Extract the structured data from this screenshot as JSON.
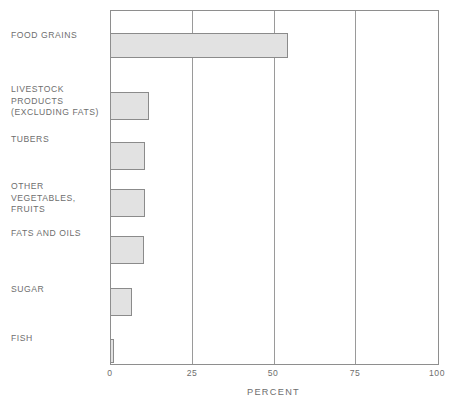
{
  "chart_data": {
    "type": "bar",
    "orientation": "horizontal",
    "title": "",
    "subtitle": "",
    "xlabel": "PERCENT",
    "ylabel": "",
    "xlim": [
      0,
      100
    ],
    "xticks": [
      "0",
      "25",
      "50",
      "75",
      "100"
    ],
    "xtick_values": [
      0,
      25,
      50,
      75,
      100
    ],
    "grid": true,
    "grid_axis": "x",
    "legend": false,
    "legend_position": "none",
    "categories": [
      "FOOD GRAINS",
      "LIVESTOCK\nPRODUCTS\n(EXCLUDING FATS)",
      "TUBERS",
      "OTHER\nVEGETABLES,\nFRUITS",
      "FATS AND OILS",
      "SUGAR",
      "FISH"
    ],
    "values": [
      54,
      11.5,
      10.5,
      10.5,
      10,
      6.5,
      1
    ],
    "bar_fill_color": "#e2e2e2",
    "bar_border_color": "#8b8b8b",
    "axis_color": "#8e8e8e",
    "text_color": "#6e6e6e"
  },
  "layout": {
    "bar_rows": [
      {
        "top": 22,
        "height": 25,
        "label_top": 30
      },
      {
        "top": 81,
        "height": 28,
        "label_top": 84
      },
      {
        "top": 131,
        "height": 28,
        "label_top": 134
      },
      {
        "top": 178,
        "height": 28,
        "label_top": 181
      },
      {
        "top": 225,
        "height": 28,
        "label_top": 228
      },
      {
        "top": 277,
        "height": 28,
        "label_top": 284
      },
      {
        "top": 328,
        "height": 24,
        "label_top": 333
      }
    ]
  }
}
